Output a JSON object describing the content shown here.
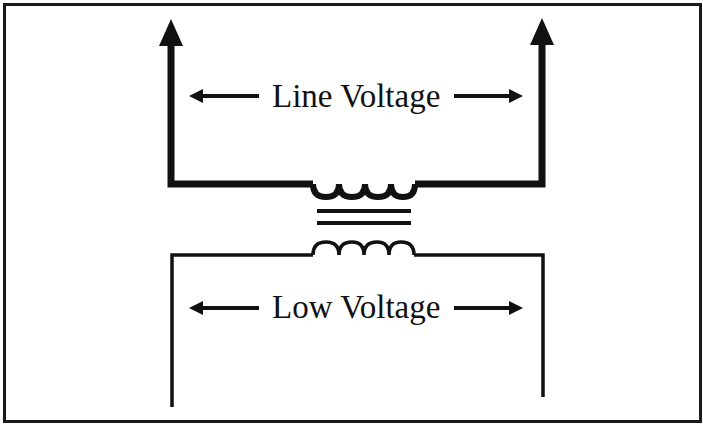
{
  "diagram": {
    "type": "transformer-schematic",
    "primary": {
      "label": "Line Voltage",
      "coil_turns": 4,
      "terminals": "arrows-up"
    },
    "secondary": {
      "label": "Low Voltage",
      "coil_turns": 4,
      "terminals": "open-leads"
    },
    "core": {
      "lines": 2
    },
    "colors": {
      "stroke": "#111111",
      "background": "#ffffff",
      "frame": "#1a1a1a"
    }
  }
}
